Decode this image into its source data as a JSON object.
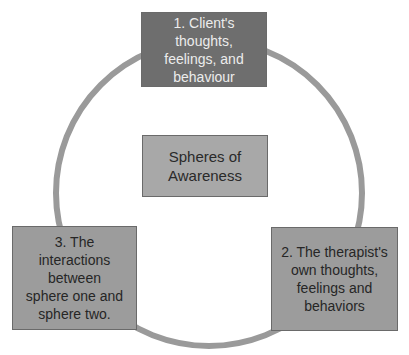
{
  "diagram": {
    "type": "cycle",
    "title": "Spheres of Awareness",
    "center": {
      "label": "Spheres of\nAwareness"
    },
    "nodes": [
      {
        "id": 1,
        "label": "1. Client's\nthoughts,\nfeelings, and\nbehaviour",
        "position": "top"
      },
      {
        "id": 2,
        "label": "2. The therapist's\nown thoughts,\nfeelings and\nbehaviors",
        "position": "bottom-right"
      },
      {
        "id": 3,
        "label": "3. The\ninteractions\nbetween\nsphere one and\nsphere two.",
        "position": "bottom-left"
      }
    ],
    "colors": {
      "ring": "#9a9a9a",
      "top_box": "#6e6e6e",
      "center_box": "#a8a8a8",
      "side_boxes": "#9c9c9c"
    }
  }
}
